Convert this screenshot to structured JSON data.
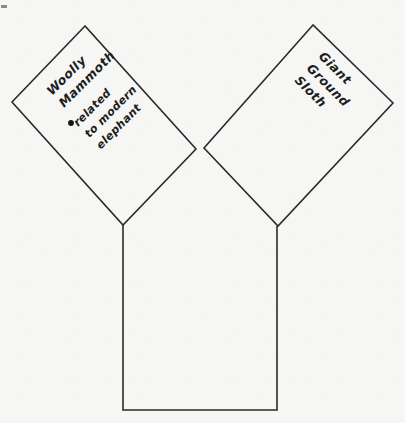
{
  "canvas": {
    "width": 405,
    "height": 423,
    "background_color": "#f6f6f5",
    "stroke_color": "#2b2b2b",
    "text_color": "#1d1d1d"
  },
  "diagram": {
    "type": "y-chart",
    "panels": [
      {
        "id": "left-arm",
        "name": "woolly-mammoth-panel",
        "rotation_deg": -45,
        "title": "Woolly Mammoth",
        "title_lines": [
          "Woolly",
          "Mammoth"
        ],
        "bullets": [
          {
            "marker": "•",
            "text": "related to modern elephant",
            "lines": [
              "related",
              "to modern",
              "elephant"
            ]
          }
        ]
      },
      {
        "id": "right-arm",
        "name": "giant-ground-sloth-panel",
        "rotation_deg": 45,
        "title": "Giant Ground Sloth",
        "title_lines": [
          "Giant",
          "Ground",
          "Sloth"
        ],
        "bullets": []
      },
      {
        "id": "stem",
        "name": "shared-traits-panel",
        "rotation_deg": 0,
        "title": "",
        "title_lines": [],
        "bullets": []
      }
    ],
    "geometry": {
      "left_square": "85,26 12,102 123,225 196,149",
      "right_square": "313,25 204,148 278,226 393,103",
      "stem_rect": "123,225 123,410 277,410 277,226"
    }
  },
  "corner_mark": {
    "label": "page-corner-artifact",
    "x": 2,
    "y": 6
  }
}
